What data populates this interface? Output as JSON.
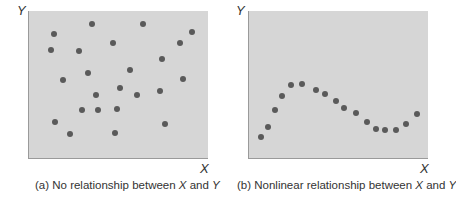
{
  "chart_data": [
    {
      "type": "scatter",
      "title": "",
      "caption_prefix": "(a) No relationship between ",
      "caption_x": "X",
      "caption_mid": " and ",
      "caption_y": "Y",
      "xlabel": "X",
      "ylabel": "Y",
      "grid": false,
      "xlim": [
        0,
        180
      ],
      "ylim": [
        0,
        148
      ],
      "points": [
        [
          25,
          125
        ],
        [
          63,
          135
        ],
        [
          115,
          135
        ],
        [
          164,
          127
        ],
        [
          22,
          109
        ],
        [
          50,
          108
        ],
        [
          84,
          116
        ],
        [
          152,
          116
        ],
        [
          134,
          100
        ],
        [
          34,
          79
        ],
        [
          59,
          86
        ],
        [
          102,
          89
        ],
        [
          155,
          80
        ],
        [
          92,
          70
        ],
        [
          67,
          63
        ],
        [
          109,
          63
        ],
        [
          132,
          67
        ],
        [
          53,
          48
        ],
        [
          69,
          48
        ],
        [
          88,
          49
        ],
        [
          26,
          36
        ],
        [
          41,
          24
        ],
        [
          86,
          25
        ],
        [
          137,
          34
        ]
      ]
    },
    {
      "type": "scatter",
      "title": "",
      "caption_prefix": "(b) Nonlinear relationship between ",
      "caption_x": "X",
      "caption_mid": " and ",
      "caption_y": "Y",
      "xlabel": "X",
      "ylabel": "Y",
      "grid": false,
      "xlim": [
        0,
        180
      ],
      "ylim": [
        0,
        148
      ],
      "points": [
        [
          12,
          21
        ],
        [
          19,
          31
        ],
        [
          26,
          48
        ],
        [
          33,
          62
        ],
        [
          42,
          73
        ],
        [
          53,
          75
        ],
        [
          67,
          68
        ],
        [
          76,
          64
        ],
        [
          87,
          57
        ],
        [
          96,
          50
        ],
        [
          108,
          45
        ],
        [
          119,
          36
        ],
        [
          128,
          29
        ],
        [
          137,
          28
        ],
        [
          148,
          28
        ],
        [
          158,
          34
        ],
        [
          169,
          44
        ]
      ]
    }
  ]
}
